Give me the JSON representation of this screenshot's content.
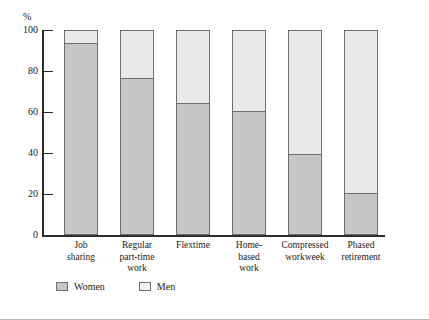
{
  "chart_data": {
    "type": "bar",
    "subtype": "stacked-100-percent",
    "title": "",
    "xlabel": "",
    "ylabel": "%",
    "ylim": [
      0,
      100
    ],
    "yticks": [
      0,
      20,
      40,
      60,
      80,
      100
    ],
    "ytick_labels": [
      "0",
      "20",
      "40",
      "60",
      "80",
      "100"
    ],
    "grid": false,
    "legend_position": "bottom-left",
    "categories": [
      "Job\nsharing",
      "Regular\npart-time\nwork",
      "Flextime",
      "Home-\nbased\nwork",
      "Compressed\nworkweek",
      "Phased\nretirement"
    ],
    "series": [
      {
        "name": "Women",
        "color": "#c6c6c6",
        "values": [
          93,
          76,
          64,
          60,
          39,
          20
        ]
      },
      {
        "name": "Men",
        "color": "#eaeaea",
        "values": [
          7,
          24,
          36,
          40,
          61,
          80
        ]
      }
    ]
  },
  "legend": {
    "items": [
      {
        "label": "Women",
        "swatch": "women-swatch"
      },
      {
        "label": "Men",
        "swatch": "men-swatch"
      }
    ]
  }
}
